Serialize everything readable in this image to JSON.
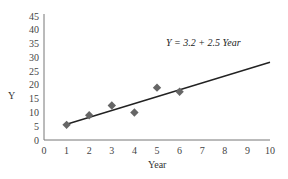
{
  "chart_data": {
    "type": "scatter",
    "title": "",
    "xlabel": "Year",
    "ylabel": "Y",
    "xlim": [
      0,
      10
    ],
    "ylim": [
      0,
      45
    ],
    "x_ticks": [
      0,
      1,
      2,
      3,
      4,
      5,
      6,
      7,
      8,
      9,
      10
    ],
    "y_ticks": [
      0,
      5,
      10,
      15,
      20,
      25,
      30,
      35,
      40,
      45
    ],
    "grid": false,
    "legend": null,
    "series": [
      {
        "name": "Observed",
        "marker": "diamond",
        "color": "#666666",
        "x": [
          1,
          2,
          3,
          4,
          5,
          6
        ],
        "y": [
          5.5,
          9,
          12.5,
          10,
          19,
          17.5
        ]
      }
    ],
    "trendline": {
      "intercept": 3.2,
      "slope": 2.5,
      "x_range": [
        1,
        10
      ],
      "color": "#222222"
    },
    "annotations": [
      {
        "text": "Y = 3.2 + 2.5 Year",
        "x": 5.5,
        "y": 34,
        "style": "italic"
      }
    ]
  },
  "labels": {
    "xlabel": "Year",
    "ylabel": "Y",
    "equation": "Y = 3.2 + 2.5 Year"
  }
}
